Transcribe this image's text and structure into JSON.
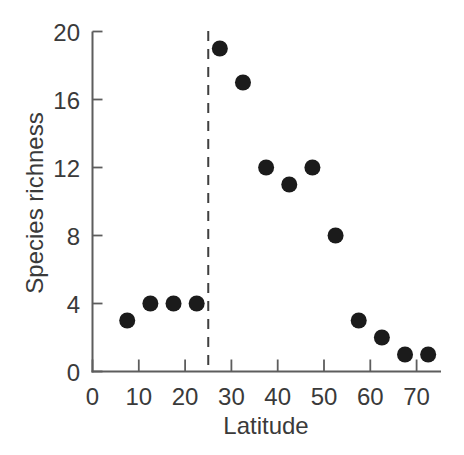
{
  "figure": {
    "background_color": "#ffffff"
  },
  "chart_data": {
    "type": "scatter",
    "title": "",
    "xlabel": "Latitude",
    "ylabel": "Species richness",
    "xlim": [
      0,
      75
    ],
    "ylim": [
      0,
      20.5
    ],
    "x_ticks": [
      0,
      10,
      20,
      30,
      40,
      50,
      60,
      70
    ],
    "y_ticks": [
      0,
      4,
      8,
      12,
      16,
      20
    ],
    "points": [
      {
        "x": 7.5,
        "y": 3
      },
      {
        "x": 12.5,
        "y": 4
      },
      {
        "x": 17.5,
        "y": 4
      },
      {
        "x": 22.5,
        "y": 4
      },
      {
        "x": 27.5,
        "y": 19
      },
      {
        "x": 32.5,
        "y": 17
      },
      {
        "x": 37.5,
        "y": 12
      },
      {
        "x": 42.5,
        "y": 11
      },
      {
        "x": 47.5,
        "y": 12
      },
      {
        "x": 52.5,
        "y": 8
      },
      {
        "x": 57.5,
        "y": 3
      },
      {
        "x": 62.5,
        "y": 2
      },
      {
        "x": 67.5,
        "y": 1
      },
      {
        "x": 72.5,
        "y": 1
      }
    ],
    "reference_line": {
      "orientation": "vertical",
      "x": 25,
      "style": "dashed"
    },
    "grid": false,
    "legend": false,
    "style": {
      "marker_shape": "circle",
      "marker_radius_px": 8,
      "marker_color": "#1b1b1b",
      "axis_color": "#5d5d5d",
      "text_color": "#3a3a3a",
      "reference_line_color": "#3f3f3f"
    }
  }
}
